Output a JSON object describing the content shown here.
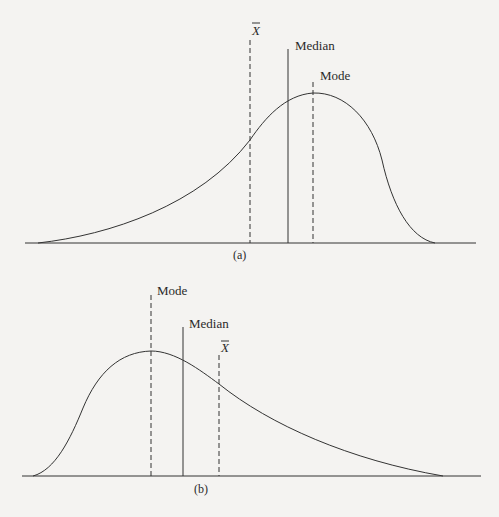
{
  "figures": [
    {
      "id": "a",
      "caption": "(a)",
      "skew": "negative (left-skewed)",
      "markers": [
        {
          "symbol": "X̄",
          "label": "Mean",
          "style": "dashed"
        },
        {
          "symbol": "",
          "label": "Median",
          "style": "solid"
        },
        {
          "symbol": "",
          "label": "Mode",
          "style": "dashed"
        }
      ]
    },
    {
      "id": "b",
      "caption": "(b)",
      "skew": "positive (right-skewed)",
      "markers": [
        {
          "symbol": "",
          "label": "Mode",
          "style": "dashed"
        },
        {
          "symbol": "",
          "label": "Median",
          "style": "solid"
        },
        {
          "symbol": "X̄",
          "label": "Mean",
          "style": "dashed"
        }
      ]
    }
  ],
  "labels": {
    "a_mean": "X",
    "a_median": "Median",
    "a_mode": "Mode",
    "a_caption": "(a)",
    "b_mode": "Mode",
    "b_median": "Median",
    "b_mean": "X",
    "b_caption": "(b)"
  }
}
